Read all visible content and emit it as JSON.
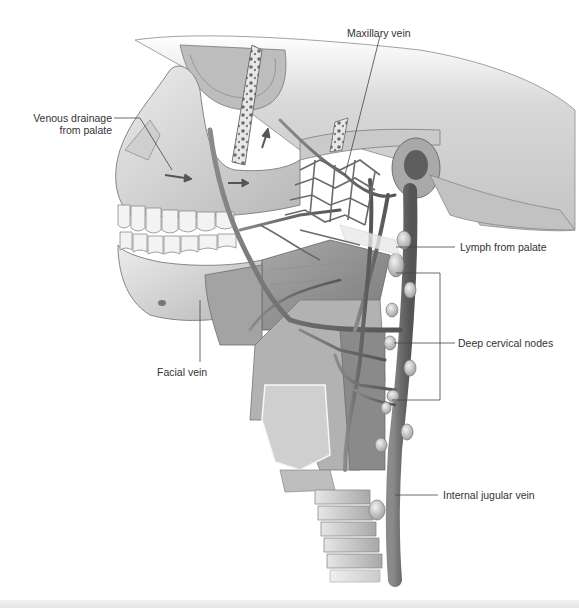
{
  "figure": {
    "colors": {
      "background": "#ffffff",
      "bone": "#d9d9d9",
      "bone_shadow": "#9a9a9a",
      "vein": "#6e6e6e",
      "muscle": "#8c8c8c",
      "teeth": "#f0f0f0",
      "node": "#cfcfcf",
      "leader_line": "#444444",
      "label_text": "#333333"
    }
  },
  "labels": {
    "venous_drainage_line1": "Venous drainage",
    "venous_drainage_line2": "from palate",
    "maxillary_vein": "Maxillary vein",
    "lymph_from_palate": "Lymph from palate",
    "deep_cervical_nodes": "Deep cervical nodes",
    "facial_vein": "Facial vein",
    "internal_jugular_vein": "Internal jugular vein"
  }
}
